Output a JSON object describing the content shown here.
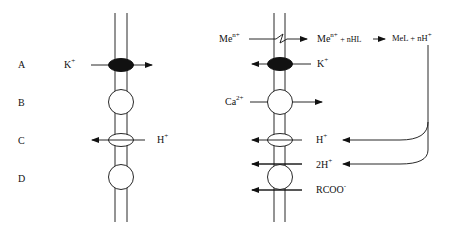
{
  "left_panel": {
    "row_labels": [
      "A",
      "B",
      "C",
      "D"
    ],
    "ions": {
      "k": {
        "base": "K",
        "charge": "+"
      },
      "h": {
        "base": "H",
        "charge": "+"
      }
    }
  },
  "right_panel": {
    "reaction": {
      "metal_in": {
        "base": "Me",
        "charge": "n+"
      },
      "metal_mid": {
        "base": "Me",
        "charge": "n+"
      },
      "ligand": "+ nHL",
      "product": "MeL + nH",
      "product_charge": "+"
    },
    "ions": {
      "k": {
        "base": "K",
        "charge": "+"
      },
      "ca": {
        "base": "Ca",
        "charge": "2+"
      },
      "h": {
        "base": "H",
        "charge": "+"
      },
      "two_h": {
        "base": "2H",
        "charge": "+"
      },
      "rcoo": {
        "base": "RCOO",
        "charge": "-"
      }
    }
  },
  "colors": {
    "stroke": "#111111",
    "fill_dark": "#111111",
    "background": "#ffffff"
  }
}
